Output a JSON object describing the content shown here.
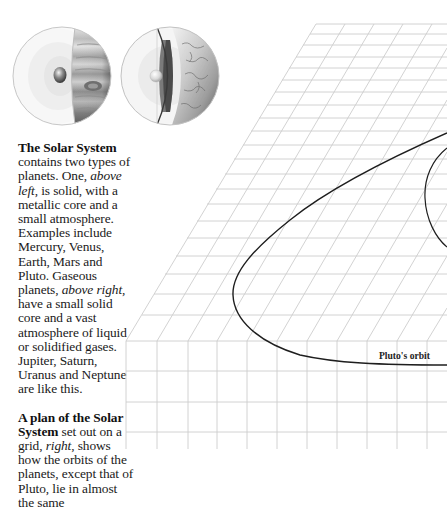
{
  "illustration": {
    "left_planet": {
      "type": "gaseous",
      "label": "gas-giant-cutaway"
    },
    "right_planet": {
      "type": "solid",
      "label": "rocky-planet-cutaway"
    }
  },
  "caption": {
    "para1": {
      "lead": "The Solar System",
      "t1": " contains two types of planets. One, ",
      "i1": "above left",
      "t2": ", is solid, with a metallic core and a small atmosphere. Examples include Mercury, Venus, Earth, Mars and Pluto. Gaseous planets, ",
      "i2": "above right",
      "t3": ", have a small solid core and a vast atmosphere of liquid or solidified gases. Jupiter, Saturn, Uranus and Neptune are like this."
    },
    "para2": {
      "lead": "A plan of the Solar System",
      "t1": " set out on a grid, ",
      "i1": "right",
      "t2": ", shows how the orbits of the planets, except that of Pluto, lie in almost the same"
    }
  },
  "diagram": {
    "orbit_label": "Pluto's orbit",
    "grid_color": "#c8c8c8",
    "orbit_color": "#1e1e1e"
  }
}
